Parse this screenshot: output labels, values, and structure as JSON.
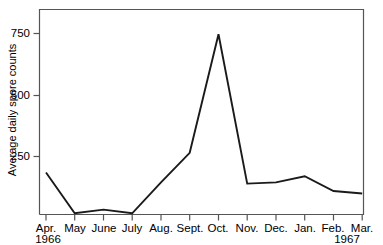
{
  "chart_data": {
    "type": "line",
    "title": "",
    "xlabel": "",
    "ylabel": "Average daily spore counts",
    "categories": [
      "Apr.",
      "May",
      "June",
      "July",
      "Aug.",
      "Sept.",
      "Oct.",
      "Nov.",
      "Dec.",
      "Jan.",
      "Feb.",
      "Mar."
    ],
    "values": [
      170,
      5,
      20,
      5,
      130,
      250,
      730,
      125,
      130,
      155,
      95,
      85
    ],
    "series": [
      {
        "name": "Average daily spore counts",
        "values": [
          170,
          5,
          20,
          5,
          130,
          250,
          730,
          125,
          130,
          155,
          95,
          85
        ]
      }
    ],
    "ylim": [
      0,
      830
    ],
    "ytick_values": [
      250,
      500,
      750
    ],
    "ytick_labels": [
      "250",
      "500",
      "750"
    ],
    "grid": false,
    "legend": null,
    "year_annotations": [
      {
        "label": "1966",
        "at_category": "Apr."
      },
      {
        "label": "1967",
        "at_category": "Feb."
      }
    ],
    "line_color": "#1a1a1a",
    "axis_color": "#4d4d4d",
    "background_color": "#ffffff"
  },
  "axes": {
    "y_label": "Average daily spore counts",
    "y_ticks": [
      "750",
      "500",
      "250"
    ],
    "x_ticks": [
      "Apr.",
      "May",
      "June",
      "July",
      "Aug.",
      "Sept.",
      "Oct.",
      "Nov.",
      "Dec.",
      "Jan.",
      "Feb.",
      "Mar."
    ],
    "years": [
      "1966",
      "1967"
    ]
  }
}
